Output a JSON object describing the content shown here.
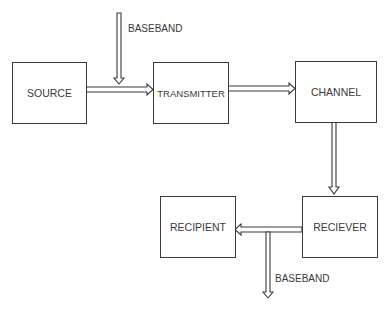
{
  "diagram": {
    "nodes": [
      {
        "id": "source",
        "label": "SOURCE"
      },
      {
        "id": "transmitter",
        "label": "TRANSMITTER"
      },
      {
        "id": "channel",
        "label": "CHANNEL"
      },
      {
        "id": "reciever",
        "label": "RECIEVER"
      },
      {
        "id": "recipient",
        "label": "RECIPIENT"
      }
    ],
    "edges": [
      {
        "from": "source",
        "to": "transmitter"
      },
      {
        "from": "baseband_in",
        "to": "source-transmitter link"
      },
      {
        "from": "transmitter",
        "to": "channel"
      },
      {
        "from": "channel",
        "to": "reciever"
      },
      {
        "from": "reciever",
        "to": "recipient"
      },
      {
        "from": "reciever-recipient link",
        "to": "baseband_out"
      }
    ],
    "labels": {
      "baseband_in": "BASEBAND",
      "baseband_out": "BASEBAND"
    }
  }
}
